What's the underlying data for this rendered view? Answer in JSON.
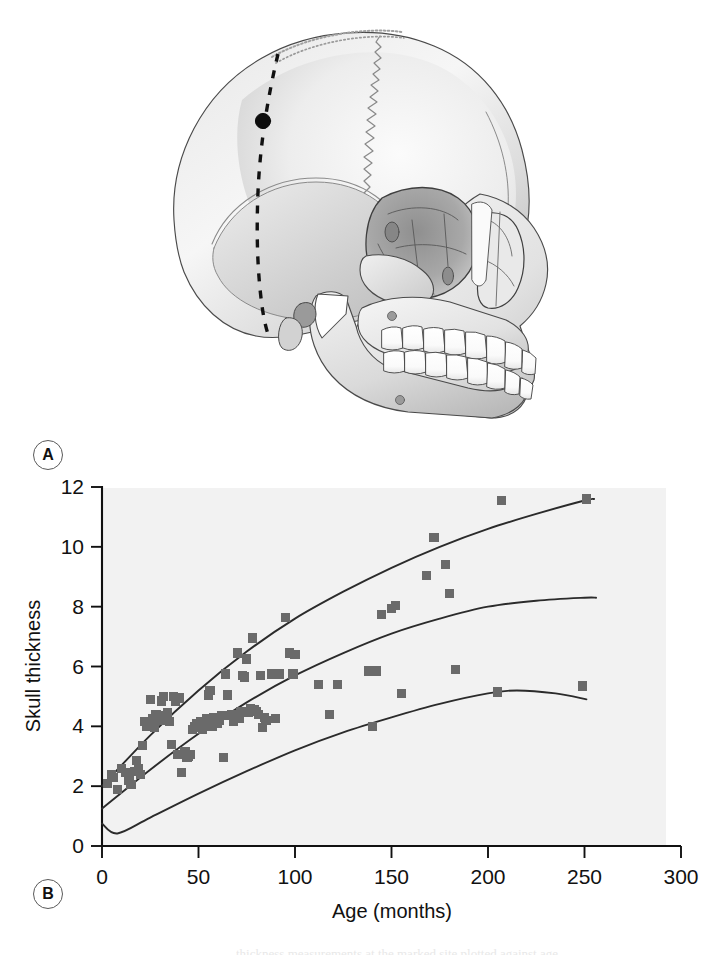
{
  "figure": {
    "panels": [
      {
        "tag": "A",
        "name": "skull-illustration"
      },
      {
        "tag": "B",
        "name": "skull-thickness-scatter"
      }
    ]
  },
  "panel_a": {
    "tag": "A",
    "description": "Lateral view line drawing of a human skull with a dashed coronal reference line over the parietal region and a filled black dot marking the skull thickness measurement site",
    "annotations": {
      "measurement_point": "measurement-site-dot",
      "reference_line": "dashed-coronal-line",
      "suture": "coronal-suture"
    }
  },
  "panel_b": {
    "tag": "B"
  },
  "caption": {
    "partial_line": "thickness measurements at the marked site plotted against age"
  },
  "chart_data": {
    "type": "scatter",
    "title": "",
    "xlabel": "Age (months)",
    "ylabel": "Skull thickness",
    "xlim": [
      0,
      300
    ],
    "ylim": [
      0,
      12
    ],
    "xticks": [
      0,
      50,
      100,
      150,
      200,
      250,
      300
    ],
    "yticks": [
      0,
      2,
      4,
      6,
      8,
      10,
      12
    ],
    "grid": false,
    "legend": null,
    "plot_background": "#f2f2f2",
    "marker_color": "#6a6a6a",
    "curve_color": "#2b2b2b",
    "points": [
      [
        3,
        2.1
      ],
      [
        5,
        2.4
      ],
      [
        6,
        2.3
      ],
      [
        8,
        1.9
      ],
      [
        10,
        2.6
      ],
      [
        12,
        2.45
      ],
      [
        14,
        2.2
      ],
      [
        15,
        2.05
      ],
      [
        17,
        2.5
      ],
      [
        18,
        2.85
      ],
      [
        19,
        2.6
      ],
      [
        20,
        2.4
      ],
      [
        21,
        3.35
      ],
      [
        22,
        4.15
      ],
      [
        23,
        4.0
      ],
      [
        24,
        4.1
      ],
      [
        25,
        4.9
      ],
      [
        26,
        4.25
      ],
      [
        27,
        3.95
      ],
      [
        28,
        4.4
      ],
      [
        29,
        4.35
      ],
      [
        30,
        4.2
      ],
      [
        31,
        4.85
      ],
      [
        32,
        5.0
      ],
      [
        33,
        4.25
      ],
      [
        34,
        4.45
      ],
      [
        35,
        4.15
      ],
      [
        36,
        3.4
      ],
      [
        37,
        5.0
      ],
      [
        38,
        4.85
      ],
      [
        39,
        3.05
      ],
      [
        40,
        4.95
      ],
      [
        41,
        2.45
      ],
      [
        42,
        3.05
      ],
      [
        43,
        3.15
      ],
      [
        44,
        2.95
      ],
      [
        45,
        3.0
      ],
      [
        46,
        3.05
      ],
      [
        47,
        3.9
      ],
      [
        48,
        4.0
      ],
      [
        49,
        4.1
      ],
      [
        50,
        3.95
      ],
      [
        51,
        4.15
      ],
      [
        52,
        3.9
      ],
      [
        53,
        4.05
      ],
      [
        54,
        4.25
      ],
      [
        55,
        5.05
      ],
      [
        56,
        5.2
      ],
      [
        57,
        4.0
      ],
      [
        58,
        4.3
      ],
      [
        59,
        4.15
      ],
      [
        60,
        4.1
      ],
      [
        61,
        4.2
      ],
      [
        62,
        4.35
      ],
      [
        63,
        2.95
      ],
      [
        64,
        5.75
      ],
      [
        65,
        5.05
      ],
      [
        66,
        4.35
      ],
      [
        67,
        4.4
      ],
      [
        68,
        4.15
      ],
      [
        70,
        6.45
      ],
      [
        71,
        4.25
      ],
      [
        72,
        4.5
      ],
      [
        73,
        5.7
      ],
      [
        74,
        5.65
      ],
      [
        75,
        6.25
      ],
      [
        76,
        4.45
      ],
      [
        77,
        4.6
      ],
      [
        78,
        6.95
      ],
      [
        79,
        4.55
      ],
      [
        80,
        4.5
      ],
      [
        81,
        4.4
      ],
      [
        82,
        5.7
      ],
      [
        83,
        3.95
      ],
      [
        84,
        4.3
      ],
      [
        85,
        4.2
      ],
      [
        88,
        5.75
      ],
      [
        90,
        4.25
      ],
      [
        92,
        5.75
      ],
      [
        95,
        7.65
      ],
      [
        97,
        6.45
      ],
      [
        99,
        5.75
      ],
      [
        100,
        6.4
      ],
      [
        112,
        5.4
      ],
      [
        118,
        4.4
      ],
      [
        122,
        5.4
      ],
      [
        138,
        5.85
      ],
      [
        140,
        4.0
      ],
      [
        142,
        5.85
      ],
      [
        145,
        7.75
      ],
      [
        150,
        7.95
      ],
      [
        152,
        8.05
      ],
      [
        155,
        5.1
      ],
      [
        168,
        9.05
      ],
      [
        172,
        10.3
      ],
      [
        178,
        9.4
      ],
      [
        180,
        8.45
      ],
      [
        183,
        5.9
      ],
      [
        205,
        5.15
      ],
      [
        207,
        11.55
      ],
      [
        249,
        5.35
      ],
      [
        251,
        11.6
      ]
    ],
    "curves": [
      {
        "name": "upper-percentile-curve",
        "description": "Upper reference percentile curve rising from about 2.0 at age 0 to about 11.6 at age 250",
        "points": [
          [
            0,
            2.0
          ],
          [
            25,
            3.7
          ],
          [
            50,
            5.2
          ],
          [
            75,
            6.5
          ],
          [
            100,
            7.6
          ],
          [
            125,
            8.5
          ],
          [
            150,
            9.3
          ],
          [
            175,
            10.0
          ],
          [
            200,
            10.6
          ],
          [
            225,
            11.1
          ],
          [
            250,
            11.55
          ],
          [
            255,
            11.6
          ]
        ]
      },
      {
        "name": "median-curve",
        "description": "Median reference curve rising from about 1.25 at age 0 to about 8.3 at age 250",
        "points": [
          [
            0,
            1.25
          ],
          [
            25,
            2.55
          ],
          [
            50,
            3.75
          ],
          [
            75,
            4.8
          ],
          [
            100,
            5.7
          ],
          [
            125,
            6.45
          ],
          [
            150,
            7.1
          ],
          [
            175,
            7.6
          ],
          [
            200,
            8.0
          ],
          [
            225,
            8.2
          ],
          [
            250,
            8.3
          ],
          [
            256,
            8.3
          ]
        ]
      },
      {
        "name": "lower-percentile-curve",
        "description": "Lower reference percentile curve dipping to about 0.4 near age 8 then rising to a peak near 5.2 around age 210 and declining slightly to about 4.9 at age 250",
        "points": [
          [
            0,
            0.75
          ],
          [
            8,
            0.42
          ],
          [
            25,
            0.95
          ],
          [
            50,
            1.75
          ],
          [
            75,
            2.5
          ],
          [
            100,
            3.2
          ],
          [
            125,
            3.8
          ],
          [
            150,
            4.3
          ],
          [
            175,
            4.75
          ],
          [
            200,
            5.1
          ],
          [
            215,
            5.2
          ],
          [
            235,
            5.1
          ],
          [
            251,
            4.9
          ]
        ]
      }
    ]
  }
}
